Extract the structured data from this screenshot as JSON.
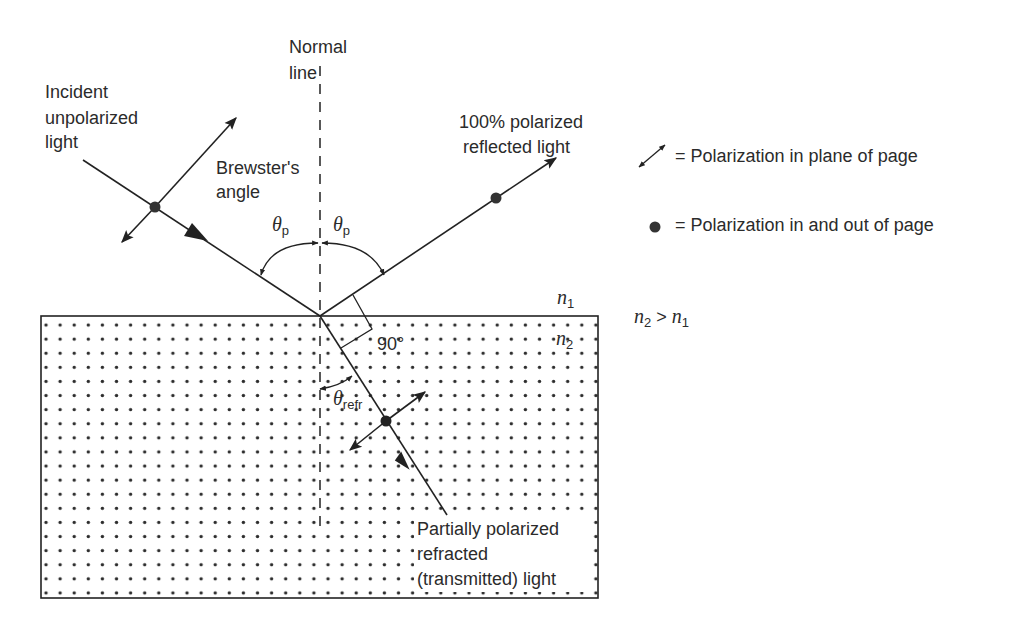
{
  "diagram": {
    "labels": {
      "normal_line": [
        "Normal",
        "line"
      ],
      "incident": [
        "Incident",
        "unpolarized",
        "light"
      ],
      "brewster": [
        "Brewster's",
        "angle"
      ],
      "reflected": [
        "100% polarized",
        "reflected light"
      ],
      "refracted": [
        "Partially polarized",
        "refracted",
        "(transmitted) light"
      ],
      "theta_p": "θ",
      "theta_p_sub": "p",
      "theta_refr": "θ",
      "theta_refr_sub": "refr",
      "right_angle": "90°",
      "n1": "n",
      "n1_sub": "1",
      "n2": "n",
      "n2_sub": "2",
      "relation": {
        "a": "n",
        "a_sub": "2",
        "op": " > ",
        "b": "n",
        "b_sub": "1"
      }
    },
    "legend": [
      {
        "icon": "double-arrow-icon",
        "text": "= Polarization in plane of page"
      },
      {
        "icon": "dot-icon",
        "text": "= Polarization in and out of page"
      }
    ],
    "colors": {
      "ink": "#222222",
      "medium_dots": "#2b2b2b",
      "background": "#ffffff"
    }
  }
}
